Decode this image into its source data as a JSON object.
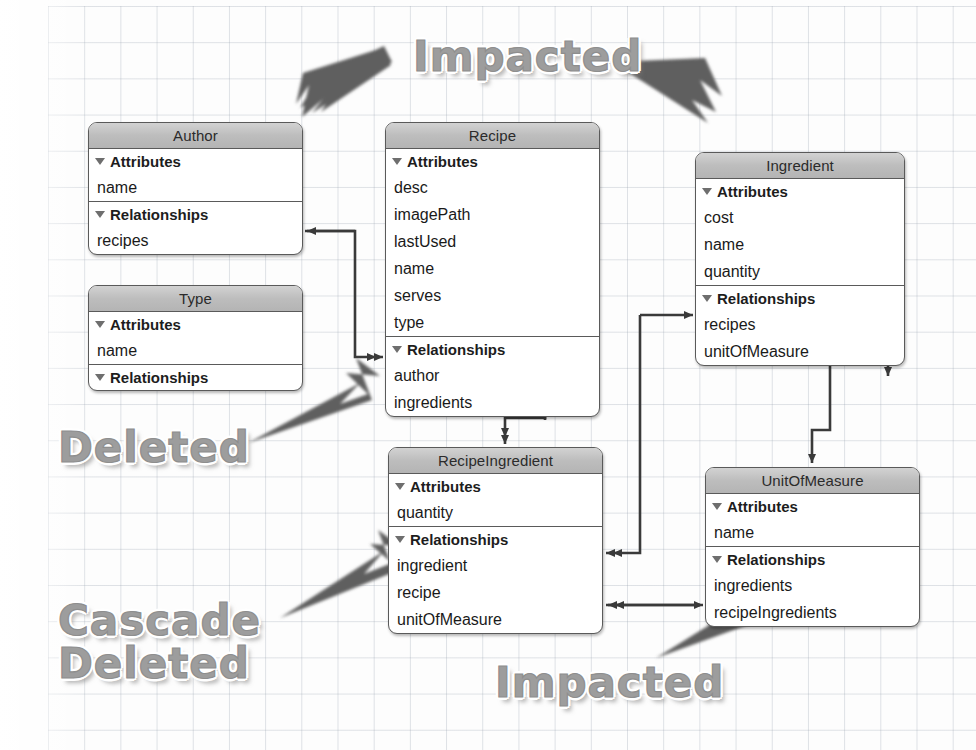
{
  "diagram": {
    "background": "graph-paper",
    "grid_color": "#96a0af"
  },
  "entities": [
    {
      "id": "author",
      "name": "Author",
      "x": 88,
      "y": 122,
      "w": 215,
      "sections": [
        {
          "head": "Attributes",
          "rows": [
            "name"
          ]
        },
        {
          "head": "Relationships",
          "rows": [
            "recipes"
          ]
        }
      ]
    },
    {
      "id": "type",
      "name": "Type",
      "x": 88,
      "y": 285,
      "w": 215,
      "sections": [
        {
          "head": "Attributes",
          "rows": [
            "name"
          ]
        },
        {
          "head": "Relationships",
          "rows": []
        }
      ]
    },
    {
      "id": "recipe",
      "name": "Recipe",
      "x": 385,
      "y": 122,
      "w": 215,
      "sections": [
        {
          "head": "Attributes",
          "rows": [
            "desc",
            "imagePath",
            "lastUsed",
            "name",
            "serves",
            "type"
          ]
        },
        {
          "head": "Relationships",
          "rows": [
            "author",
            "ingredients"
          ]
        }
      ]
    },
    {
      "id": "ingredient",
      "name": "Ingredient",
      "x": 695,
      "y": 152,
      "w": 210,
      "sections": [
        {
          "head": "Attributes",
          "rows": [
            "cost",
            "name",
            "quantity"
          ]
        },
        {
          "head": "Relationships",
          "rows": [
            "recipes",
            "unitOfMeasure"
          ]
        }
      ]
    },
    {
      "id": "recipeingredient",
      "name": "RecipeIngredient",
      "x": 388,
      "y": 447,
      "w": 215,
      "sections": [
        {
          "head": "Attributes",
          "rows": [
            "quantity"
          ]
        },
        {
          "head": "Relationships",
          "rows": [
            "ingredient",
            "recipe",
            "unitOfMeasure"
          ]
        }
      ]
    },
    {
      "id": "unitofmeasure",
      "name": "UnitOfMeasure",
      "x": 705,
      "y": 467,
      "w": 215,
      "sections": [
        {
          "head": "Attributes",
          "rows": [
            "name"
          ]
        },
        {
          "head": "Relationships",
          "rows": [
            "ingredients",
            "recipeIngredients"
          ]
        }
      ]
    }
  ],
  "annotations": [
    {
      "id": "impacted-top",
      "label": "Impacted",
      "x": 413,
      "y": 36,
      "size": 42
    },
    {
      "id": "deleted",
      "label": "Deleted",
      "x": 58,
      "y": 427,
      "size": 42
    },
    {
      "id": "cascade-deleted",
      "label": "Cascade\nDeleted",
      "x": 58,
      "y": 600,
      "size": 42
    },
    {
      "id": "impacted-bottom",
      "label": "Impacted",
      "x": 495,
      "y": 662,
      "size": 42
    }
  ],
  "relationships": [
    {
      "from": "author.recipes",
      "to": "recipe.author",
      "kind": "to-many"
    },
    {
      "from": "recipe.ingredients",
      "to": "recipeingredient",
      "kind": "to-many"
    },
    {
      "from": "recipeingredient.recipe",
      "to": "recipe",
      "kind": "to-one"
    },
    {
      "from": "ingredient.recipes",
      "to": "recipeingredient.ingredient",
      "kind": "to-many"
    },
    {
      "from": "unitofmeasure.recipeIngredients",
      "to": "recipeingredient.unitOfMeasure",
      "kind": "to-many"
    },
    {
      "from": "ingredient.unitOfMeasure",
      "to": "unitofmeasure",
      "kind": "to-one"
    }
  ]
}
